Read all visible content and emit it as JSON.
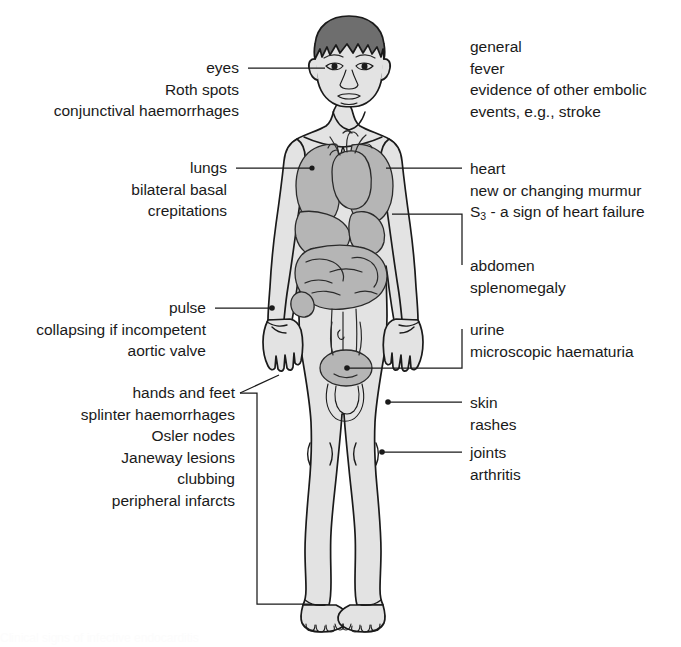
{
  "diagram": {
    "title": "Clinical signs of infective endocarditis",
    "figure_name": "human-body-anatomy-figure",
    "colors": {
      "skin_fill": "#e3e3e3",
      "organ_fill": "#b5b5b5",
      "hair_fill": "#6e6e6e",
      "outline": "#1a1a1a",
      "text": "#1a1a1a",
      "background": "#ffffff"
    }
  },
  "labels": {
    "eyes": {
      "heading": "eyes",
      "lines": [
        "Roth spots",
        "conjunctival haemorrhages"
      ]
    },
    "lungs": {
      "heading": "lungs",
      "lines": [
        "bilateral basal",
        "crepitations"
      ]
    },
    "pulse": {
      "heading": "pulse",
      "lines": [
        "collapsing if incompetent",
        "aortic valve"
      ]
    },
    "hands_and_feet": {
      "heading": "hands and feet",
      "lines": [
        "splinter haemorrhages",
        "Osler nodes",
        "Janeway lesions",
        "clubbing",
        "peripheral infarcts"
      ]
    },
    "general": {
      "heading": "general",
      "lines": [
        "fever",
        "evidence of other embolic",
        "events, e.g., stroke"
      ]
    },
    "heart": {
      "heading": "heart",
      "line_murmur": "new or changing murmur",
      "s3_prefix": "S",
      "s3_sub": "3",
      "s3_suffix": " - a sign of heart failure"
    },
    "abdomen": {
      "heading": "abdomen",
      "lines": [
        "splenomegaly"
      ]
    },
    "urine": {
      "heading": "urine",
      "lines": [
        "microscopic haematuria"
      ]
    },
    "skin": {
      "heading": "skin",
      "lines": [
        "rashes"
      ]
    },
    "joints": {
      "heading": "joints",
      "lines": [
        "arthritis"
      ]
    }
  },
  "caption": {
    "text": "Clinical signs of infective endocarditis"
  }
}
